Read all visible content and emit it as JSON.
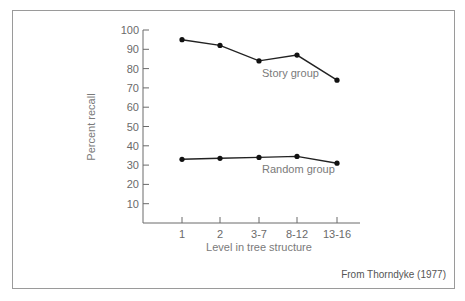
{
  "chart_data": {
    "type": "line",
    "title": "",
    "xlabel": "Level in tree structure",
    "ylabel": "Percent recall",
    "categories": [
      "1",
      "2",
      "3-7",
      "8-12",
      "13-16"
    ],
    "ylim": [
      0,
      100
    ],
    "yticks": [
      10,
      20,
      30,
      40,
      50,
      60,
      70,
      80,
      90,
      100
    ],
    "grid": false,
    "legend": "inline labels",
    "series": [
      {
        "name": "Story group",
        "values": [
          95,
          92,
          84,
          87,
          74
        ]
      },
      {
        "name": "Random group",
        "values": [
          33,
          33.5,
          34,
          34.5,
          31
        ]
      }
    ],
    "annotation": "From Thorndyke (1977)"
  },
  "labels": {
    "xlabel": "Level in tree structure",
    "ylabel": "Percent recall",
    "story": "Story group",
    "random": "Random group",
    "credit": "From Thorndyke (1977)"
  },
  "colors": {
    "line": "#222222",
    "axis": "#6a6a6a",
    "text": "#6a6a6a",
    "border": "#9a9a9a"
  }
}
